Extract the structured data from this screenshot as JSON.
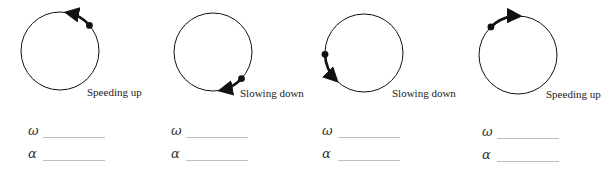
{
  "diagram": {
    "stroke_color": "#111111",
    "panels": [
      {
        "id": 1,
        "label": "Speeding up",
        "circle": {
          "cx": 60,
          "cy": 51,
          "r": 39
        },
        "dot_angle_deg": -41,
        "arrow_angle_deg": -80,
        "motion": "counterclockwise",
        "label_pos": {
          "x": 87,
          "y": 86
        },
        "omega_symbol": "ω",
        "alpha_symbol": "α",
        "omega_answer": "",
        "alpha_answer": "",
        "answers_pos": {
          "x": 28,
          "y_omega": 124,
          "y_alpha": 147
        }
      },
      {
        "id": 2,
        "label": "Slowing down",
        "circle": {
          "cx": 213,
          "cy": 52,
          "r": 39
        },
        "dot_angle_deg": 43,
        "arrow_angle_deg": 79,
        "motion": "clockwise",
        "label_pos": {
          "x": 240,
          "y": 87
        },
        "omega_symbol": "ω",
        "alpha_symbol": "α",
        "omega_answer": "",
        "alpha_answer": "",
        "answers_pos": {
          "x": 171,
          "y_omega": 124,
          "y_alpha": 147
        }
      },
      {
        "id": 3,
        "label": "Slowing down",
        "circle": {
          "cx": 364,
          "cy": 53,
          "r": 39
        },
        "dot_angle_deg": 178,
        "arrow_angle_deg": 135,
        "motion": "counterclockwise",
        "label_pos": {
          "x": 392,
          "y": 87
        },
        "omega_symbol": "ω",
        "alpha_symbol": "α",
        "omega_answer": "",
        "alpha_answer": "",
        "answers_pos": {
          "x": 322,
          "y_omega": 124,
          "y_alpha": 147
        }
      },
      {
        "id": 4,
        "label": "Speeding up",
        "circle": {
          "cx": 518,
          "cy": 55,
          "r": 39
        },
        "dot_angle_deg": -134,
        "arrow_angle_deg": -88,
        "motion": "clockwise",
        "label_pos": {
          "x": 546,
          "y": 88
        },
        "omega_symbol": "ω",
        "alpha_symbol": "α",
        "omega_answer": "",
        "alpha_answer": "",
        "answers_pos": {
          "x": 482,
          "y_omega": 125,
          "y_alpha": 148
        }
      }
    ]
  }
}
